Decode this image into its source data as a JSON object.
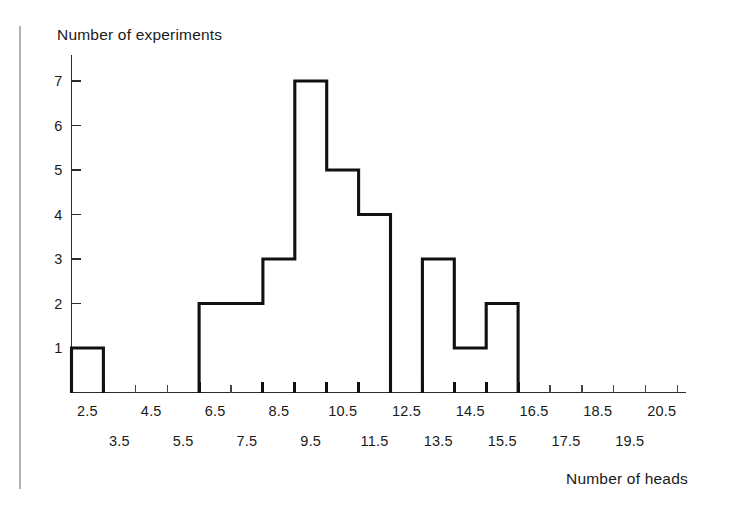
{
  "chart_data": {
    "type": "bar",
    "title": "",
    "subtitle": "",
    "xlabel": "Number of heads",
    "ylabel": "Number of experiments",
    "grid": false,
    "legend": null,
    "xlim": [
      2,
      21
    ],
    "ylim": [
      0,
      7.6
    ],
    "y_ticks": [
      1,
      2,
      3,
      4,
      5,
      6,
      7
    ],
    "x_tick_labels_upper": [
      "2.5",
      "4.5",
      "6.5",
      "8.5",
      "10.5",
      "12.5",
      "14.5",
      "16.5",
      "18.5",
      "20.5"
    ],
    "x_tick_labels_lower": [
      "3.5",
      "5.5",
      "7.5",
      "9.5",
      "11.5",
      "13.5",
      "15.5",
      "17.5",
      "19.5"
    ],
    "bin_edges": [
      2,
      3,
      4,
      5,
      6,
      7,
      8,
      9,
      10,
      11,
      12,
      13,
      14,
      15,
      16,
      17,
      18,
      19,
      20,
      21
    ],
    "categories": [
      "2.5",
      "3.5",
      "4.5",
      "5.5",
      "6.5",
      "7.5",
      "8.5",
      "9.5",
      "10.5",
      "11.5",
      "12.5",
      "13.5",
      "14.5",
      "15.5",
      "16.5",
      "17.5",
      "18.5",
      "19.5",
      "20.5"
    ],
    "values": [
      1,
      0,
      0,
      0,
      2,
      2,
      3,
      7,
      5,
      4,
      0,
      3,
      1,
      2,
      0,
      0,
      0,
      0,
      0
    ],
    "annotations": []
  },
  "axes": {
    "y_label": "Number of experiments",
    "x_label": "Number of heads"
  },
  "colors": {
    "ink": "#1a1a1a",
    "outline": "#111111",
    "axis": "#2b2b2b",
    "page_edge": "#b3b3b3",
    "background": "#ffffff"
  }
}
